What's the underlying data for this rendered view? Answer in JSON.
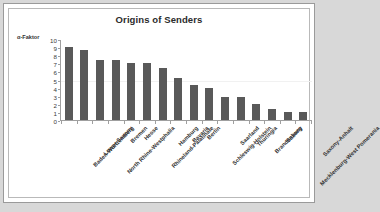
{
  "chart_data": {
    "type": "bar",
    "title": "Origins of Senders",
    "ylabel": "α-Faktor",
    "xlabel": "",
    "ylim": [
      0,
      10
    ],
    "ytick_step": 1,
    "yticks": [
      "10",
      "9",
      "8",
      "7",
      "6",
      "5",
      "4",
      "3",
      "2",
      "1",
      "0"
    ],
    "grid": false,
    "legend": "none",
    "bar_color": "#595959",
    "categories": [
      "Baden-Württemberg",
      "Lower Saxony",
      "North Rhine-Westphalia",
      "Bremen",
      "Hesse",
      "Rhineland-Palatinate",
      "Hamburg",
      "Bavaria",
      "Berlin",
      "Schleswig-Holstein",
      "Saarland",
      "Thuringia",
      "Brandenburg",
      "Saxony",
      "Mecklenburg-West Pomerania",
      "Saxony-Anhalt"
    ],
    "values": [
      9.05,
      8.6,
      7.45,
      7.35,
      7.05,
      7.0,
      6.45,
      5.2,
      4.3,
      4.0,
      2.85,
      2.8,
      1.95,
      1.4,
      1.05,
      1.05
    ]
  }
}
